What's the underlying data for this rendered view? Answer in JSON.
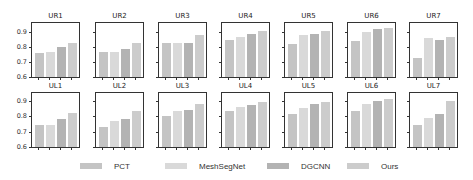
{
  "chart_data": {
    "type": "bar",
    "layout": "small-multiples 2x7",
    "ylim": [
      0.6,
      0.94
    ],
    "yticks": [
      "0.6",
      "0.7",
      "0.8",
      "0.9"
    ],
    "grid": false,
    "legend_position": "bottom",
    "series_names": [
      "PCT",
      "MeshSegNet",
      "DGCNN",
      "Ours"
    ],
    "colors": [
      "#c4c4c4",
      "#d9d9d9",
      "#b3b3b3",
      "#cccccc"
    ],
    "panels": [
      {
        "title": "UR1",
        "values": [
          0.76,
          0.77,
          0.8,
          0.83
        ]
      },
      {
        "title": "UR2",
        "values": [
          0.77,
          0.77,
          0.79,
          0.83
        ]
      },
      {
        "title": "UR3",
        "values": [
          0.83,
          0.83,
          0.83,
          0.88
        ]
      },
      {
        "title": "UR4",
        "values": [
          0.85,
          0.87,
          0.89,
          0.91
        ]
      },
      {
        "title": "UR5",
        "values": [
          0.82,
          0.88,
          0.89,
          0.91
        ]
      },
      {
        "title": "UR6",
        "values": [
          0.84,
          0.9,
          0.92,
          0.93
        ]
      },
      {
        "title": "UR7",
        "values": [
          0.73,
          0.86,
          0.85,
          0.87
        ]
      },
      {
        "title": "UL1",
        "values": [
          0.74,
          0.74,
          0.78,
          0.82
        ]
      },
      {
        "title": "UL2",
        "values": [
          0.73,
          0.77,
          0.78,
          0.83
        ]
      },
      {
        "title": "UL3",
        "values": [
          0.8,
          0.83,
          0.84,
          0.88
        ]
      },
      {
        "title": "UL4",
        "values": [
          0.83,
          0.86,
          0.87,
          0.89
        ]
      },
      {
        "title": "UL5",
        "values": [
          0.81,
          0.85,
          0.88,
          0.89
        ]
      },
      {
        "title": "UL6",
        "values": [
          0.83,
          0.88,
          0.9,
          0.91
        ]
      },
      {
        "title": "UL7",
        "values": [
          0.74,
          0.79,
          0.81,
          0.9
        ]
      }
    ]
  },
  "legend": {
    "items": [
      {
        "label": "PCT",
        "color": "#c4c4c4"
      },
      {
        "label": "MeshSegNet",
        "color": "#d9d9d9"
      },
      {
        "label": "DGCNN",
        "color": "#b3b3b3"
      },
      {
        "label": "Ours",
        "color": "#cccccc"
      }
    ]
  }
}
